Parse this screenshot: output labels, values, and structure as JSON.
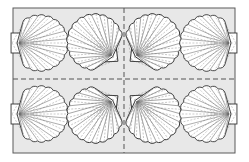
{
  "figure": {
    "caption": "Scallop shell tile pattern",
    "frame": {
      "x": 13,
      "y": 8,
      "w": 222,
      "h": 145
    },
    "divider_center": {
      "x": 124,
      "y": 79
    },
    "colors": {
      "background": "#ffffff",
      "panel": "#e8e8e8",
      "frame": "#5a5a5a",
      "dash": "#555555",
      "shell_fill": "#ffffff",
      "shell_stroke": "#333333",
      "rib_stroke": "#6a6a6a"
    },
    "shells": [
      {
        "id": "shell-1",
        "cx": 40,
        "cy": 43,
        "r": 27,
        "hinge_angle": 180,
        "ear": "rect"
      },
      {
        "id": "shell-2",
        "cx": 95,
        "cy": 42,
        "r": 27,
        "hinge_angle": 40,
        "ear": "triangle"
      },
      {
        "id": "shell-3",
        "cx": 153,
        "cy": 42,
        "r": 27,
        "hinge_angle": 140,
        "ear": "triangle"
      },
      {
        "id": "shell-4",
        "cx": 208,
        "cy": 43,
        "r": 27,
        "hinge_angle": 0,
        "ear": "rect"
      },
      {
        "id": "shell-5",
        "cx": 40,
        "cy": 114,
        "r": 27,
        "hinge_angle": 180,
        "ear": "rect"
      },
      {
        "id": "shell-6",
        "cx": 95,
        "cy": 115,
        "r": 27,
        "hinge_angle": -40,
        "ear": "triangle"
      },
      {
        "id": "shell-7",
        "cx": 153,
        "cy": 115,
        "r": 27,
        "hinge_angle": -140,
        "ear": "triangle"
      },
      {
        "id": "shell-8",
        "cx": 208,
        "cy": 114,
        "r": 27,
        "hinge_angle": 0,
        "ear": "rect"
      }
    ]
  }
}
